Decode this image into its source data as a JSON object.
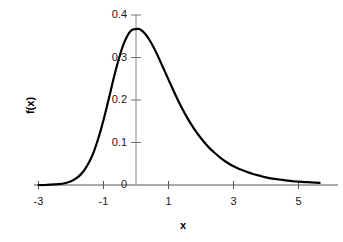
{
  "chart_data": {
    "type": "line",
    "title": "",
    "subtitle": "",
    "xlabel": "x",
    "ylabel": "f(x)",
    "xlim": [
      -3.0,
      5.65
    ],
    "ylim": [
      0.0,
      0.4
    ],
    "xticks": [
      -3,
      -1,
      1,
      3,
      5
    ],
    "xtick_labels": [
      "-3",
      "-1",
      "1",
      "3",
      "5"
    ],
    "yticks": [
      0,
      0.1,
      0.2,
      0.3,
      0.4
    ],
    "ytick_labels": [
      "0",
      "0.1",
      "0.2",
      "0.3",
      "0.4"
    ],
    "grid": false,
    "legend": null,
    "annotations": [],
    "series": [
      {
        "name": "f(x)",
        "color": "#000000",
        "line_width": 2.2,
        "peak_x": 0.1,
        "peak_y": 0.367,
        "x": [
          -3.0,
          -2.8,
          -2.6,
          -2.4,
          -2.2,
          -2.0,
          -1.9,
          -1.8,
          -1.7,
          -1.6,
          -1.5,
          -1.4,
          -1.3,
          -1.2,
          -1.1,
          -1.0,
          -0.9,
          -0.8,
          -0.7,
          -0.6,
          -0.5,
          -0.4,
          -0.3,
          -0.2,
          -0.1,
          0.0,
          0.1,
          0.2,
          0.3,
          0.4,
          0.5,
          0.6,
          0.7,
          0.8,
          0.9,
          1.0,
          1.2,
          1.4,
          1.6,
          1.8,
          2.0,
          2.2,
          2.4,
          2.6,
          2.8,
          3.0,
          3.2,
          3.4,
          3.6,
          3.8,
          4.0,
          4.2,
          4.4,
          4.6,
          4.8,
          5.0,
          5.2,
          5.4,
          5.65
        ],
        "y": [
          0.0,
          0.0,
          0.001,
          0.002,
          0.004,
          0.009,
          0.013,
          0.018,
          0.025,
          0.034,
          0.046,
          0.06,
          0.078,
          0.1,
          0.125,
          0.153,
          0.183,
          0.215,
          0.247,
          0.277,
          0.304,
          0.328,
          0.346,
          0.359,
          0.366,
          0.367,
          0.367,
          0.362,
          0.354,
          0.343,
          0.33,
          0.315,
          0.299,
          0.282,
          0.265,
          0.248,
          0.214,
          0.183,
          0.155,
          0.131,
          0.11,
          0.092,
          0.077,
          0.064,
          0.053,
          0.044,
          0.037,
          0.031,
          0.026,
          0.022,
          0.018,
          0.015,
          0.013,
          0.011,
          0.009,
          0.008,
          0.007,
          0.006,
          0.005
        ]
      }
    ]
  },
  "axes": {
    "x_axis_name": "x-axis",
    "y_axis_name": "y-axis"
  }
}
